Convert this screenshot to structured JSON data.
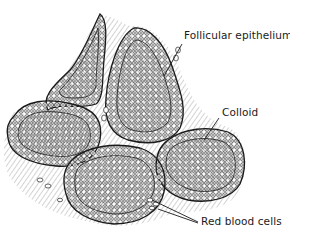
{
  "figure": {
    "colors": {
      "ink": "#1a1a1a",
      "background": "#ffffff",
      "hatch": "#5a5a5a"
    }
  },
  "labels": {
    "follicular_epithelium": "Follicular epithelium",
    "colloid": "Colloid",
    "red_blood_cells": "Red blood cells"
  }
}
